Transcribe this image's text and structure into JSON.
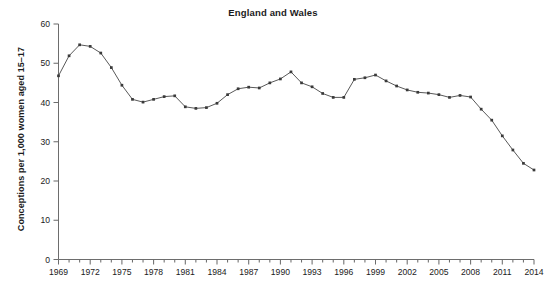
{
  "chart_data": {
    "type": "line",
    "title": "England and Wales",
    "xlabel": "",
    "ylabel": "Conceptions per 1,000 women aged 15–17",
    "xlim": [
      1969,
      2014
    ],
    "ylim": [
      0,
      60
    ],
    "grid": false,
    "legend": null,
    "ytick_labels": [
      "0",
      "10",
      "20",
      "30",
      "40",
      "50",
      "60"
    ],
    "ytick_values": [
      0,
      10,
      20,
      30,
      40,
      50,
      60
    ],
    "xtick_labels": [
      "1969",
      "1972",
      "1975",
      "1978",
      "1981",
      "1984",
      "1987",
      "1990",
      "1993",
      "1996",
      "1999",
      "2002",
      "2005",
      "2008",
      "2011",
      "2014"
    ],
    "xtick_values": [
      1969,
      1972,
      1975,
      1978,
      1981,
      1984,
      1987,
      1990,
      1993,
      1996,
      1999,
      2002,
      2005,
      2008,
      2011,
      2014
    ],
    "x": [
      1969,
      1970,
      1971,
      1972,
      1973,
      1974,
      1975,
      1976,
      1977,
      1978,
      1979,
      1980,
      1981,
      1982,
      1983,
      1984,
      1985,
      1986,
      1987,
      1988,
      1989,
      1990,
      1991,
      1992,
      1993,
      1994,
      1995,
      1996,
      1997,
      1998,
      1999,
      2000,
      2001,
      2002,
      2003,
      2004,
      2005,
      2006,
      2007,
      2008,
      2009,
      2010,
      2011,
      2012,
      2013,
      2014
    ],
    "values": [
      46.8,
      51.9,
      54.7,
      54.3,
      52.6,
      48.9,
      44.4,
      40.8,
      40.1,
      40.8,
      41.5,
      41.7,
      38.9,
      38.5,
      38.7,
      39.8,
      42.0,
      43.5,
      43.9,
      43.7,
      45.0,
      46.0,
      47.8,
      45.0,
      44.0,
      42.3,
      41.3,
      41.3,
      45.9,
      46.3,
      47.0,
      45.5,
      44.2,
      43.2,
      42.6,
      42.4,
      42.0,
      41.3,
      41.8,
      41.4,
      38.3,
      35.5,
      31.5,
      27.9,
      24.5,
      22.8
    ]
  },
  "axis": {
    "ytitle": "Conceptions per 1,000 women aged 15–17"
  }
}
